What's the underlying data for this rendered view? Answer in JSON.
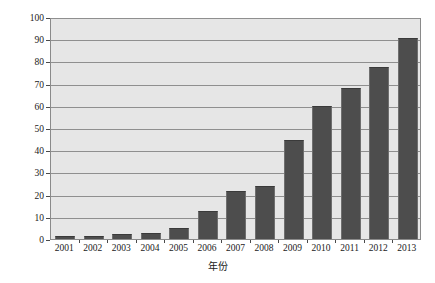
{
  "chart_data": {
    "type": "bar",
    "title": "",
    "xlabel": "年份",
    "ylabel": "海水淡化产水规模(万吨/日)",
    "categories": [
      "2001",
      "2002",
      "2003",
      "2004",
      "2005",
      "2006",
      "2007",
      "2008",
      "2009",
      "2010",
      "2011",
      "2012",
      "2013"
    ],
    "values": [
      1.2,
      1.3,
      2.3,
      2.8,
      4.8,
      12.5,
      21.5,
      24.0,
      44.5,
      60.0,
      68.0,
      77.5,
      90.5
    ],
    "series": [
      {
        "name": "海水淡化产水规模",
        "values": [
          1.2,
          1.3,
          2.3,
          2.8,
          4.8,
          12.5,
          21.5,
          24.0,
          44.5,
          60.0,
          68.0,
          77.5,
          90.5
        ]
      }
    ],
    "ylim": [
      0,
      100
    ],
    "yticks": [
      0,
      10,
      20,
      30,
      40,
      50,
      60,
      70,
      80,
      90,
      100
    ],
    "ytick_labels": [
      "0",
      "10",
      "20",
      "30",
      "40",
      "50",
      "60",
      "70",
      "80",
      "90",
      "100"
    ],
    "grid": true,
    "legend": false,
    "legend_position": "none",
    "colors": {
      "bar_fill": "#4d4d4d",
      "plot_background": "#e6e6e6",
      "gridline": "#8f8f8f",
      "axis": "#8a8a8a",
      "text": "#1a1a1a"
    }
  }
}
